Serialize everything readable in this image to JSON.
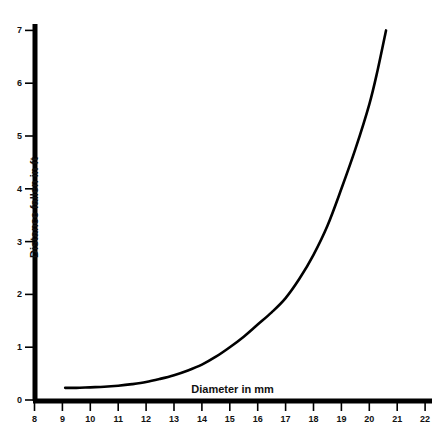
{
  "chart_data": {
    "type": "line",
    "title": "",
    "xlabel": "Diameter in mm",
    "ylabel": "Distance fallen in ft",
    "xlim": [
      8,
      22
    ],
    "ylim": [
      0,
      7
    ],
    "xticks": [
      8,
      9,
      10,
      11,
      12,
      13,
      14,
      15,
      16,
      17,
      18,
      19,
      20,
      21,
      22
    ],
    "yticks": [
      0,
      1,
      2,
      3,
      4,
      5,
      6,
      7
    ],
    "xtick_labels": [
      "8",
      "9",
      "10",
      "11",
      "12",
      "13",
      "14",
      "15",
      "16",
      "17",
      "18",
      "19",
      "20",
      "21",
      "22"
    ],
    "ytick_labels": [
      "0",
      "1",
      "2",
      "3",
      "4",
      "5",
      "6",
      "7"
    ],
    "grid": false,
    "legend": false,
    "line_color": "#000000",
    "axis_color": "#000000",
    "background_color": "#ffffff",
    "series": [
      {
        "name": "Distance fallen vs diameter",
        "x": [
          9.1,
          9.5,
          10.0,
          10.5,
          11.0,
          11.5,
          12.0,
          12.5,
          13.0,
          13.5,
          14.0,
          14.5,
          15.0,
          15.5,
          16.0,
          16.5,
          17.0,
          17.5,
          18.0,
          18.5,
          19.0,
          19.5,
          20.0,
          20.3,
          20.6
        ],
        "y": [
          0.23,
          0.23,
          0.24,
          0.25,
          0.27,
          0.3,
          0.34,
          0.4,
          0.47,
          0.56,
          0.67,
          0.82,
          1.0,
          1.2,
          1.43,
          1.66,
          1.93,
          2.3,
          2.75,
          3.3,
          4.0,
          4.75,
          5.6,
          6.25,
          7.0
        ]
      }
    ]
  }
}
